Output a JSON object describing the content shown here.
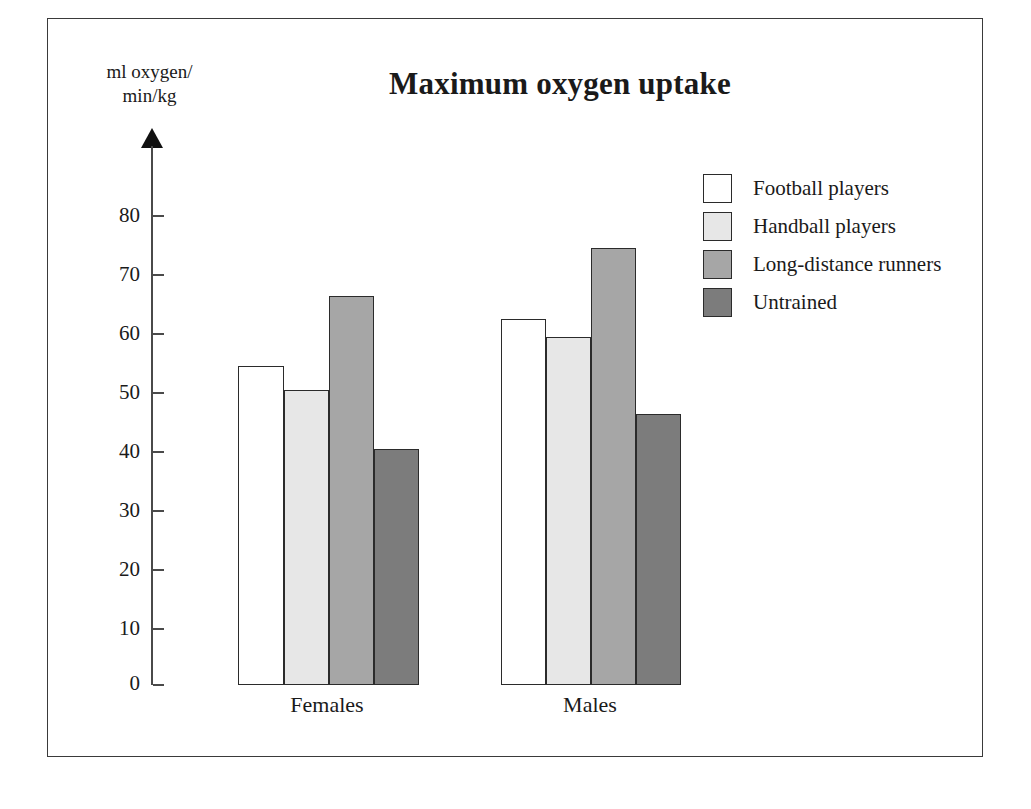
{
  "chart_data": {
    "type": "bar",
    "title": "Maximum oxygen uptake",
    "xlabel": "",
    "ylabel": "ml oxygen/ min/kg",
    "ylabel_line1": "ml oxygen/",
    "ylabel_line2": "min/kg",
    "categories": [
      "Females",
      "Males"
    ],
    "series": [
      {
        "name": "Football players",
        "values": [
          54,
          62
        ],
        "color": "#ffffff"
      },
      {
        "name": "Handball players",
        "values": [
          50,
          59
        ],
        "color": "#e7e7e7"
      },
      {
        "name": "Long-distance runners",
        "values": [
          66,
          74
        ],
        "color": "#a6a6a6"
      },
      {
        "name": "Untrained",
        "values": [
          40,
          46
        ],
        "color": "#7c7c7c"
      }
    ],
    "ylim": [
      0,
      85
    ],
    "yticks": [
      0,
      10,
      20,
      30,
      40,
      50,
      60,
      70,
      80
    ],
    "ytick_labels": [
      "0",
      "10",
      "20",
      "30",
      "40",
      "50",
      "60",
      "70",
      "80"
    ],
    "grid": false,
    "legend_position": "top-right",
    "axis_arrow": true
  },
  "legend": {
    "items": [
      {
        "label": "Football players",
        "swatch": "legend-swatch-football"
      },
      {
        "label": "Handball players",
        "swatch": "legend-swatch-handball"
      },
      {
        "label": "Long-distance runners",
        "swatch": "legend-swatch-longdistance"
      },
      {
        "label": "Untrained",
        "swatch": "legend-swatch-untrained"
      }
    ]
  },
  "colors": {
    "football": "#ffffff",
    "handball": "#e7e7e7",
    "longdistance": "#a6a6a6",
    "untrained": "#7c7c7c",
    "axis": "#4a4a4a",
    "outline": "#2b2b2b",
    "text": "#1a1a1a",
    "frame": "#3a3a3a"
  }
}
